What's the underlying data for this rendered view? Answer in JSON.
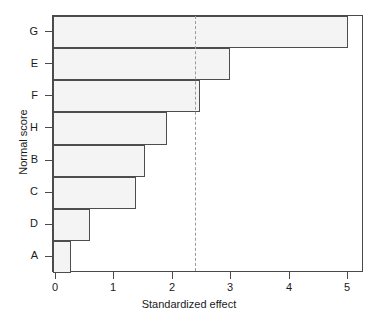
{
  "chart_data": {
    "type": "bar",
    "orientation": "horizontal",
    "title": "",
    "xlabel": "Standardized effect",
    "ylabel": "Normal score",
    "categories": [
      "G",
      "E",
      "F",
      "H",
      "B",
      "C",
      "D",
      "A"
    ],
    "values": [
      5.0,
      2.98,
      2.47,
      1.9,
      1.52,
      1.37,
      0.58,
      0.26
    ],
    "series": [
      {
        "name": "Standardized effect",
        "values": [
          5.0,
          2.98,
          2.47,
          1.9,
          1.52,
          1.37,
          0.58,
          0.26
        ]
      }
    ],
    "xlim": [
      0,
      5.27
    ],
    "xticks": [
      0,
      1,
      2,
      3,
      4,
      5
    ],
    "xtick_labels": [
      "0",
      "1",
      "2",
      "3",
      "4",
      "5"
    ],
    "ytick_labels": [
      "G",
      "E",
      "F",
      "H",
      "B",
      "C",
      "D",
      "A"
    ],
    "grid": false,
    "legend": false,
    "annotations": [
      {
        "name": "significance-threshold",
        "type": "vline",
        "value": 2.38,
        "style": "dashed",
        "color": "#9a9a9a"
      }
    ],
    "colors": {
      "bar_fill": "#f4f4f4",
      "bar_edge": "#4d4d4d",
      "axis": "#4a4a4a",
      "reference_line": "#9a9a9a",
      "text": "#1a1a1a",
      "background": "#ffffff"
    }
  }
}
